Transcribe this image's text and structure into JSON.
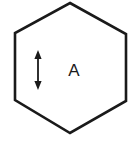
{
  "figure": {
    "background_color": "#ffffff",
    "stroke_color": "#1a1a1a",
    "width": 138,
    "height": 145
  },
  "shape": {
    "name": "hexagon",
    "sides": 6,
    "orientation": "pointy-top",
    "fill_color": "#ffffff",
    "stroke_color": "#1a1a1a",
    "stroke_width": 2.6,
    "points": "70,3 126,34 126,101 70,133 15,100 15,33"
  },
  "annotations": {
    "arrow": {
      "name": "vertical-double-headed-arrow",
      "x": 38,
      "y_top": 51,
      "y_bottom": 89,
      "color": "#1a1a1a",
      "stroke_width": 1.8,
      "head_width": 7,
      "head_length": 8,
      "double_headed": true
    },
    "label": {
      "name": "region-label-A",
      "text": "A",
      "x": 74,
      "y": 72,
      "font_size": 17,
      "color": "#1a1a1a"
    }
  }
}
